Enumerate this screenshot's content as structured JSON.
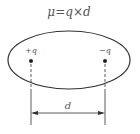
{
  "diagram": {
    "formula": "μ=q×d",
    "positive_charge_label": "+q",
    "negative_charge_label": "−q",
    "distance_label": "d",
    "colors": {
      "stroke": "#333333",
      "text": "#555555",
      "background": "#ffffff"
    }
  }
}
